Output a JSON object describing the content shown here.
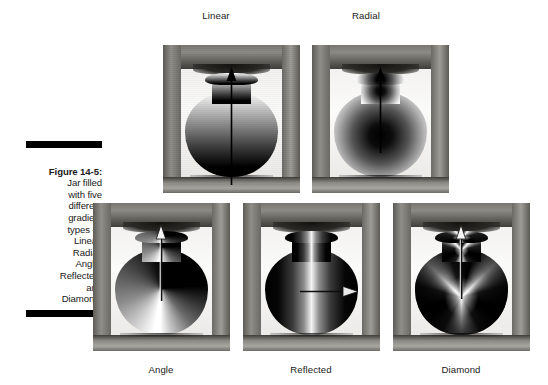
{
  "figure": {
    "number_label": "Figure 14-5:",
    "caption_body": "Jar filled\nwith five\ndifferent\ngradient\ntypes —\nLinear,\nRadial,\nAngle,\nReflected,\nand\nDiamond."
  },
  "panels": [
    {
      "id": "linear",
      "label": "Linear",
      "label_position": "top",
      "gradient_type": "linear",
      "gradient_description": "Vertical linear gradient, white at top fading to black at bottom",
      "arrow": {
        "direction": "up",
        "head": "black",
        "description": "vertical arrow pointing up from jar base to neck"
      },
      "subject": "ceramic jar in wooden crate frame"
    },
    {
      "id": "radial",
      "label": "Radial",
      "label_position": "top",
      "gradient_type": "radial",
      "gradient_description": "Radial gradient, black at center radiating out to white at edges",
      "arrow": {
        "direction": "up",
        "head": "black",
        "description": "vertical arrow pointing up from jar center to neck"
      },
      "subject": "ceramic jar in wooden crate frame"
    },
    {
      "id": "angle",
      "label": "Angle",
      "label_position": "bottom",
      "gradient_type": "angle",
      "gradient_description": "Angle (conic) gradient sweeping around the center point, hard white-to-black transition at twelve o'clock",
      "arrow": {
        "direction": "up",
        "head": "white",
        "description": "vertical white arrow pointing up from jar center to neck"
      },
      "subject": "ceramic jar in wooden crate frame"
    },
    {
      "id": "reflected",
      "label": "Reflected",
      "label_position": "bottom",
      "gradient_type": "reflected",
      "gradient_description": "Reflected gradient, bright white band down the middle mirrored to black at both left and right edges",
      "arrow": {
        "direction": "right",
        "head": "white",
        "description": "horizontal arrow pointing right from jar center"
      },
      "subject": "ceramic jar in wooden crate frame"
    },
    {
      "id": "diamond",
      "label": "Diamond",
      "label_position": "bottom",
      "gradient_type": "diamond",
      "gradient_description": "Diamond gradient, white four-point star burst at center fading to black toward the corners",
      "arrow": {
        "direction": "up",
        "head": "white",
        "description": "vertical white arrow pointing up from jar center to neck"
      },
      "subject": "ceramic jar in wooden crate frame"
    }
  ],
  "colors": {
    "page_background": "#ffffff",
    "caption_rule": "#000000",
    "text": "#1a1a1a",
    "frame_wood_light": "#b2b0aa",
    "frame_wood_dark": "#413f3b",
    "backdrop": "#f7f6f4",
    "gradient_white": "#ffffff",
    "gradient_black": "#000000"
  }
}
